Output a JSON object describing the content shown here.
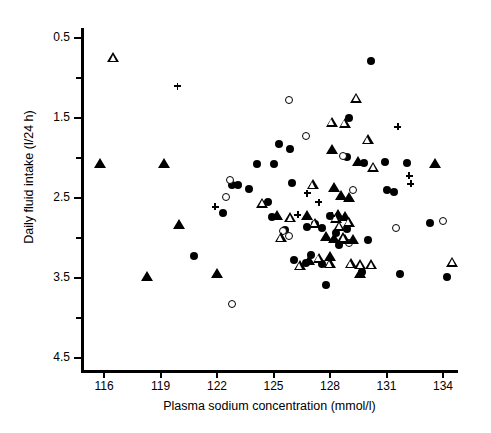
{
  "chart_data": {
    "type": "scatter",
    "title": "",
    "xlabel": "Plasma sodium concentration (mmol/l)",
    "ylabel": "Daily fluid intake (l/24 h)",
    "xlim": [
      114.7,
      135.8
    ],
    "ylim": [
      0.2,
      4.75
    ],
    "xticks": [
      116,
      119,
      122,
      125,
      128,
      131,
      134
    ],
    "yticks": [
      0.5,
      1.5,
      2.5,
      3.5,
      4.5
    ],
    "y_minor_ticks": [
      1.0,
      2.0,
      3.0,
      4.0
    ],
    "grid": false,
    "legend": "none",
    "marker_types": [
      "filled-circle",
      "open-circle",
      "filled-triangle",
      "open-triangle",
      "plus"
    ],
    "series": [
      {
        "name": "filled-circle",
        "marker": "filled-circle",
        "points": [
          [
            122.8,
            2.66
          ],
          [
            123.1,
            2.66
          ],
          [
            124.1,
            2.92
          ],
          [
            125.0,
            2.92
          ],
          [
            122.3,
            2.31
          ],
          [
            120.8,
            1.78
          ],
          [
            125.3,
            3.17
          ],
          [
            123.7,
            2.61
          ],
          [
            124.9,
            2.26
          ],
          [
            125.6,
            2.1
          ],
          [
            126.8,
            2.14
          ],
          [
            128.9,
            3.01
          ],
          [
            127.0,
            1.79
          ],
          [
            126.1,
            1.72
          ],
          [
            126.7,
            1.69
          ],
          [
            127.6,
            1.67
          ],
          [
            128.0,
            2.27
          ],
          [
            128.3,
            2.06
          ],
          [
            128.5,
            1.91
          ],
          [
            127.2,
            2.18
          ],
          [
            127.6,
            2.12
          ],
          [
            128.9,
            2.11
          ],
          [
            129.8,
            2.94
          ],
          [
            130.2,
            4.21
          ],
          [
            130.9,
            2.95
          ],
          [
            131.4,
            2.58
          ],
          [
            130.0,
            1.97
          ],
          [
            131.0,
            2.6
          ],
          [
            129.7,
            1.58
          ],
          [
            133.3,
            2.19
          ],
          [
            134.2,
            1.51
          ],
          [
            131.7,
            1.55
          ],
          [
            126.0,
            2.69
          ],
          [
            124.7,
            2.45
          ],
          [
            125.9,
            3.11
          ],
          [
            129.0,
            3.5
          ],
          [
            132.1,
            2.94
          ],
          [
            127.8,
            1.41
          ]
        ]
      },
      {
        "name": "open-circle",
        "marker": "open-circle",
        "points": [
          [
            122.7,
            2.72
          ],
          [
            122.5,
            2.51
          ],
          [
            125.8,
            3.72
          ],
          [
            126.7,
            3.28
          ],
          [
            128.7,
            3.02
          ],
          [
            125.5,
            2.09
          ],
          [
            125.8,
            2.02
          ],
          [
            129.0,
            1.94
          ],
          [
            131.5,
            2.12
          ],
          [
            134.0,
            2.21
          ],
          [
            122.8,
            1.17
          ],
          [
            129.2,
            2.6
          ]
        ]
      },
      {
        "name": "filled-triangle",
        "marker": "filled-triangle",
        "points": [
          [
            115.8,
            2.92
          ],
          [
            119.2,
            2.92
          ],
          [
            120.0,
            2.16
          ],
          [
            118.3,
            1.51
          ],
          [
            122.0,
            1.55
          ],
          [
            125.2,
            2.28
          ],
          [
            126.8,
            2.28
          ],
          [
            128.1,
            3.1
          ],
          [
            128.2,
            2.63
          ],
          [
            128.6,
            2.52
          ],
          [
            129.0,
            2.5
          ],
          [
            128.4,
            2.29
          ],
          [
            128.8,
            2.26
          ],
          [
            127.8,
            2.01
          ],
          [
            128.2,
            1.99
          ],
          [
            128.8,
            1.98
          ],
          [
            129.2,
            1.97
          ],
          [
            128.0,
            1.76
          ],
          [
            129.5,
            2.95
          ],
          [
            133.6,
            2.92
          ],
          [
            126.9,
            1.71
          ],
          [
            129.6,
            1.55
          ]
        ]
      },
      {
        "name": "open-triangle",
        "marker": "open-triangle",
        "points": [
          [
            116.5,
            4.25
          ],
          [
            124.4,
            2.43
          ],
          [
            125.9,
            2.25
          ],
          [
            127.1,
            2.66
          ],
          [
            128.1,
            3.44
          ],
          [
            128.8,
            3.43
          ],
          [
            129.4,
            3.74
          ],
          [
            130.0,
            3.22
          ],
          [
            130.3,
            2.88
          ],
          [
            128.7,
            2.0
          ],
          [
            128.3,
            2.24
          ],
          [
            128.5,
            2.14
          ],
          [
            127.4,
            1.74
          ],
          [
            128.0,
            1.67
          ],
          [
            129.1,
            1.67
          ],
          [
            129.6,
            1.66
          ],
          [
            130.2,
            1.66
          ],
          [
            134.5,
            1.69
          ],
          [
            126.4,
            1.65
          ],
          [
            125.4,
            2.0
          ],
          [
            127.2,
            2.18
          ],
          [
            129.0,
            2.19
          ]
        ]
      },
      {
        "name": "plus",
        "marker": "plus",
        "points": [
          [
            119.9,
            3.9
          ],
          [
            121.9,
            2.39
          ],
          [
            126.3,
            2.29
          ],
          [
            128.1,
            2.28
          ],
          [
            127.4,
            2.45
          ],
          [
            131.6,
            3.39
          ],
          [
            132.2,
            2.78
          ],
          [
            132.3,
            2.68
          ],
          [
            126.8,
            2.56
          ]
        ]
      }
    ]
  },
  "axes": {
    "y_title": "Daily fluid intake (l/24 h)",
    "x_title": "Plasma sodium concentration (mmol/l)",
    "ytick_labels": [
      "4.5",
      "3.5",
      "2.5",
      "1.5",
      "0.5"
    ],
    "xtick_labels": [
      "116",
      "119",
      "122",
      "125",
      "128",
      "131",
      "134"
    ]
  },
  "colors": {
    "foreground": "#000000",
    "background": "#ffffff"
  }
}
